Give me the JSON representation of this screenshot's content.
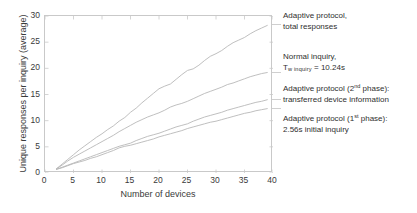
{
  "chart_data": {
    "type": "line",
    "title": "",
    "xlabel": "Number of devices",
    "ylabel": "Unique responses per inquiry (average)",
    "xlim": [
      0,
      40
    ],
    "ylim": [
      0,
      30
    ],
    "xticks": [
      0,
      5,
      10,
      15,
      20,
      25,
      30,
      35,
      40
    ],
    "yticks": [
      0,
      5,
      10,
      15,
      20,
      25,
      30
    ],
    "grid": false,
    "legend_position": "right-outside",
    "line_color": "#b8b8b8",
    "axis_color": "#c9c9c9",
    "text_color": "#2f2f2f",
    "x": [
      2,
      3,
      4,
      5,
      6,
      7,
      8,
      9,
      10,
      11,
      12,
      13,
      14,
      15,
      16,
      17,
      18,
      19,
      20,
      21,
      22,
      23,
      24,
      25,
      26,
      27,
      28,
      29,
      30,
      31,
      32,
      33,
      34,
      35,
      36,
      37,
      38,
      39
    ],
    "series": [
      {
        "name": "adaptive-total-responses",
        "label_lines": [
          "Adaptive protocol,",
          "total responses"
        ],
        "values": [
          0.8,
          1.7,
          2.6,
          3.5,
          4.4,
          5.2,
          6.0,
          6.8,
          7.5,
          8.3,
          9.0,
          9.9,
          10.6,
          11.6,
          12.4,
          13.4,
          14.3,
          15.2,
          16.1,
          16.6,
          17.0,
          17.9,
          18.8,
          19.6,
          19.9,
          20.6,
          21.5,
          22.3,
          22.8,
          23.4,
          24.2,
          24.9,
          25.4,
          25.9,
          26.6,
          27.2,
          27.7,
          28.2
        ]
      },
      {
        "name": "normal-inquiry",
        "label_lines": [
          "Normal inquiry,",
          "T_w inquiry = 10.24s"
        ],
        "label_prefix": "T",
        "label_subscript": "w inquiry",
        "label_suffix": " = 10.24s",
        "values": [
          0.8,
          1.5,
          2.3,
          3.0,
          3.6,
          4.2,
          4.8,
          5.4,
          6.0,
          6.6,
          7.2,
          7.9,
          8.5,
          9.1,
          9.7,
          10.2,
          10.7,
          11.1,
          11.5,
          12.0,
          12.6,
          13.0,
          13.3,
          13.7,
          14.2,
          14.7,
          15.2,
          15.6,
          16.0,
          16.4,
          16.9,
          17.2,
          17.6,
          18.0,
          18.4,
          18.7,
          19.0,
          19.2
        ]
      },
      {
        "name": "adaptive-2nd-phase",
        "label_lines": [
          "Adaptive protocol (2nd phase):",
          "transferred device information"
        ],
        "label_prefix": "Adaptive protocol (2",
        "label_superscript": "nd",
        "label_suffix": " phase):",
        "label_line2": "transferred device information",
        "values": [
          0.7,
          1.1,
          1.5,
          1.9,
          2.3,
          2.7,
          3.1,
          3.5,
          3.9,
          4.3,
          4.7,
          5.1,
          5.4,
          5.7,
          6.2,
          6.6,
          7.0,
          7.3,
          7.6,
          8.0,
          8.4,
          8.8,
          9.1,
          9.4,
          9.9,
          10.3,
          10.7,
          11.0,
          11.3,
          11.6,
          12.0,
          12.3,
          12.6,
          12.9,
          13.2,
          13.5,
          13.7,
          14.0
        ]
      },
      {
        "name": "adaptive-1st-phase",
        "label_lines": [
          "Adaptive protocol (1st phase):",
          "2.56s initial inquiry"
        ],
        "label_prefix": "Adaptive protocol (1",
        "label_superscript": "st",
        "label_suffix": " phase):",
        "label_line2": "2.56s initial inquiry",
        "values": [
          0.7,
          1.0,
          1.4,
          1.8,
          2.1,
          2.4,
          2.8,
          3.1,
          3.5,
          3.9,
          4.3,
          4.8,
          5.1,
          5.3,
          5.6,
          5.9,
          6.2,
          6.5,
          6.9,
          7.2,
          7.5,
          7.8,
          8.1,
          8.5,
          8.8,
          9.1,
          9.4,
          9.7,
          9.9,
          10.2,
          10.5,
          10.8,
          11.1,
          11.4,
          11.6,
          11.9,
          12.1,
          12.3
        ]
      }
    ]
  },
  "axes": {
    "xlabel": "Number of devices",
    "ylabel": "Unique responses per inquiry (average)",
    "xticks": [
      "0",
      "5",
      "10",
      "15",
      "20",
      "25",
      "30",
      "35",
      "40"
    ],
    "yticks": [
      "0",
      "5",
      "10",
      "15",
      "20",
      "25",
      "30"
    ]
  },
  "annotations": [
    {
      "id": "adaptive-total",
      "line1": "Adaptive protocol,",
      "line2": "total responses"
    },
    {
      "id": "normal-inquiry",
      "line1": "Normal inquiry,",
      "line2_prefix": "T",
      "line2_sub": "w inquiry",
      "line2_suffix": " = 10.24s"
    },
    {
      "id": "adaptive-2nd-phase",
      "line1_prefix": "Adaptive protocol (2",
      "line1_sup": "nd",
      "line1_suffix": " phase):",
      "line2": "transferred device information"
    },
    {
      "id": "adaptive-1st-phase",
      "line1_prefix": "Adaptive protocol (1",
      "line1_sup": "st",
      "line1_suffix": " phase):",
      "line2": "2.56s initial inquiry"
    }
  ]
}
